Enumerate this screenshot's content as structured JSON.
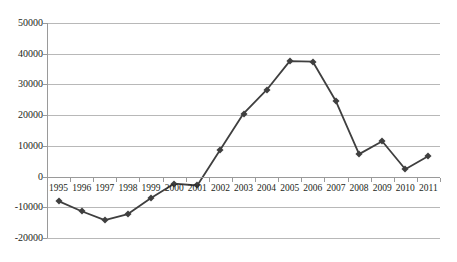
{
  "chart_data": {
    "type": "line",
    "title": "",
    "subtitle": "",
    "xlabel": "",
    "ylabel": "",
    "categories": [
      "1995",
      "1996",
      "1997",
      "1998",
      "1999",
      "2000",
      "2001",
      "2002",
      "2003",
      "2004",
      "2005",
      "2006",
      "2007",
      "2008",
      "2009",
      "2010",
      "2011"
    ],
    "values": [
      -8000,
      -11300,
      -14200,
      -12200,
      -7000,
      -2300,
      -2900,
      8800,
      20500,
      28200,
      37600,
      37400,
      24500,
      7300,
      11500,
      2400,
      6700
    ],
    "series": [
      {
        "name": "",
        "values": [
          -8000,
          -11300,
          -14200,
          -12200,
          -7000,
          -2300,
          -2900,
          8800,
          20500,
          28200,
          37600,
          37400,
          24500,
          7300,
          11500,
          2400,
          6700
        ]
      }
    ],
    "ylim": [
      -20000,
      50000
    ],
    "ytick_labels": [
      "50000",
      "40000",
      "30000",
      "20000",
      "10000",
      "0",
      "-10000",
      "-20000"
    ],
    "ytick_values": [
      50000,
      40000,
      30000,
      20000,
      10000,
      0,
      -10000,
      -20000
    ],
    "grid": true,
    "grid_axis": "y",
    "legend": "none",
    "marker": "diamond",
    "line_color": "#3f3f3f",
    "grid_color": "#b8b8b8",
    "background_color": "#ffffff"
  }
}
